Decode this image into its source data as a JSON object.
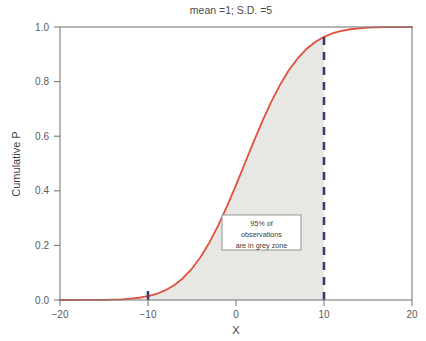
{
  "chart_data": {
    "type": "line",
    "title": "mean =1; S.D. =5",
    "xlabel": "X",
    "ylabel": "Cumulative P",
    "xlim": [
      -20,
      20
    ],
    "ylim": [
      0.0,
      1.0
    ],
    "xticks": [
      "-20",
      "-10",
      "0",
      "10",
      "20"
    ],
    "xtick_values": [
      -20,
      -10,
      0,
      10,
      20
    ],
    "yticks": [
      "0.0",
      "0.2",
      "0.4",
      "0.6",
      "0.8",
      "1.0"
    ],
    "ytick_values": [
      0.0,
      0.2,
      0.4,
      0.6,
      0.8,
      1.0
    ],
    "grid": false,
    "legend": "none",
    "distribution": {
      "mean": 1,
      "sd": 5
    },
    "series": [
      {
        "name": "Cumulative normal CDF (mean=1, S.D.=5)",
        "color": "#e2503c",
        "x": [
          -20,
          -19,
          -18,
          -17,
          -16,
          -15,
          -14,
          -13,
          -12,
          -11,
          -10,
          -9,
          -8,
          -7,
          -6,
          -5,
          -4,
          -3,
          -2,
          -1,
          0,
          1,
          2,
          3,
          4,
          5,
          6,
          7,
          8,
          9,
          10,
          11,
          12,
          13,
          14,
          15,
          16,
          17,
          18,
          19,
          20
        ],
        "y": [
          0.0,
          0.0,
          0.0001,
          0.0001,
          0.0003,
          0.0005,
          0.0013,
          0.0026,
          0.0047,
          0.0082,
          0.0139,
          0.0228,
          0.0359,
          0.0548,
          0.0808,
          0.1151,
          0.1587,
          0.2119,
          0.2743,
          0.3446,
          0.4207,
          0.5,
          0.5793,
          0.6554,
          0.7257,
          0.7881,
          0.8413,
          0.8849,
          0.9192,
          0.9452,
          0.9641,
          0.9772,
          0.9861,
          0.9918,
          0.9953,
          0.9974,
          0.9987,
          0.9993,
          0.9997,
          0.9999,
          0.9999
        ]
      }
    ],
    "shaded_region": {
      "label": "grey zone",
      "x_start": -10,
      "x_end": 10,
      "color": "#e7e7e4"
    },
    "markers": [
      {
        "name": "lower-bound-marker",
        "x": -10,
        "color": "#3c3c6e"
      }
    ],
    "reference_line": {
      "name": "upper-bound-dashed-line",
      "x": 10,
      "color": "#3c3c6e",
      "style": "dashed"
    },
    "annotation": {
      "lines": [
        "95% of",
        "observations",
        "are in grey zone"
      ],
      "x": 0.6,
      "y": 0.24,
      "boxed": true
    }
  }
}
